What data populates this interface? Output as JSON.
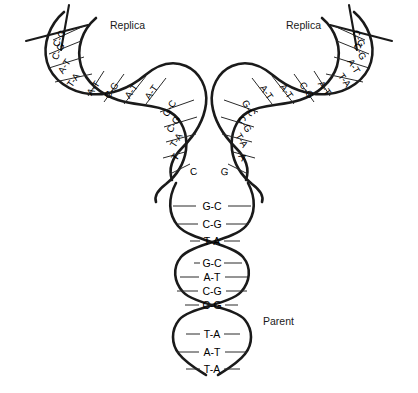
{
  "diagram": {
    "background_color": "#ffffff",
    "stroke_color": "#1a1a1a",
    "labels": {
      "replica_left": "Replica",
      "replica_right": "Replica",
      "parent": "Parent"
    },
    "parent_strand": {
      "name": "Parent",
      "base_pairs": [
        "G-C",
        "C-G",
        "T-A",
        "G-C",
        "A-T",
        "C-G",
        "C-G",
        "T-A",
        "A-T",
        "T-A"
      ],
      "segments": [
        {
          "pairs": [
            "G-C",
            "C-G",
            "T-A"
          ]
        },
        {
          "pairs": [
            "G-C",
            "A-T",
            "C-G",
            "C-G"
          ]
        },
        {
          "pairs": [
            "T-A",
            "A-T",
            "T-A"
          ]
        }
      ]
    },
    "replica_left": {
      "name": "Replica",
      "segments": [
        {
          "position": "outer",
          "pairs": [
            "C-G",
            "C-G",
            "A-T",
            "T-A"
          ]
        },
        {
          "position": "middle",
          "pairs": [
            "A-T",
            "C-G",
            "A-T",
            "A-T"
          ]
        },
        {
          "position": "inner",
          "pairs": [
            "G-C",
            "C-G",
            "T-A"
          ]
        }
      ],
      "unpaired_bases": [
        "T",
        "C"
      ]
    },
    "replica_right": {
      "name": "Replica",
      "segments": [
        {
          "position": "inner",
          "pairs": [
            "G-C",
            "C-G",
            "T-A"
          ]
        },
        {
          "position": "middle",
          "pairs": [
            "A-T",
            "A-T",
            "C-G",
            "A-T"
          ]
        },
        {
          "position": "outer",
          "pairs": [
            "C-G",
            "C-G",
            "A-T",
            "T-A"
          ]
        }
      ],
      "unpaired_bases": [
        "G",
        "A"
      ]
    },
    "bases": {
      "G": "G",
      "C": "C",
      "A": "A",
      "T": "T",
      "G-C": "G-C",
      "C-G": "C-G",
      "A-T": "A-T",
      "T-A": "T-A"
    }
  }
}
